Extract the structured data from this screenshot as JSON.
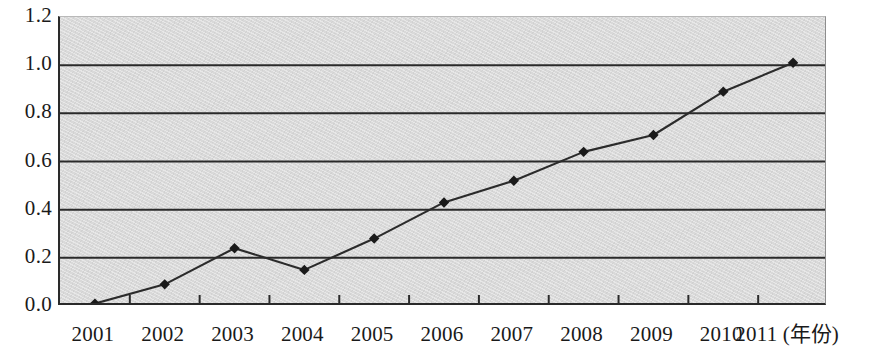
{
  "chart_data": {
    "type": "line",
    "title": "",
    "subtitle": "",
    "xlabel": "(年份)",
    "ylabel": "",
    "categories": [
      "2001",
      "2002",
      "2003",
      "2004",
      "2005",
      "2006",
      "2007",
      "2008",
      "2009",
      "2010",
      "2011"
    ],
    "values": [
      0.01,
      0.09,
      0.24,
      0.15,
      0.28,
      0.43,
      0.52,
      0.64,
      0.71,
      0.89,
      1.01
    ],
    "series": [
      {
        "name": "",
        "values": [
          0.01,
          0.09,
          0.24,
          0.15,
          0.28,
          0.43,
          0.52,
          0.64,
          0.71,
          0.89,
          1.01
        ]
      }
    ],
    "ylim": [
      0.0,
      1.2
    ],
    "y_ticks": [
      "0.0",
      "0.2",
      "0.4",
      "0.6",
      "0.8",
      "1.0",
      "1.2"
    ],
    "y_tick_values": [
      0.0,
      0.2,
      0.4,
      0.6,
      0.8,
      1.0,
      1.2
    ],
    "x_ticks": [
      "2001",
      "2002",
      "2003",
      "2004",
      "2005",
      "2006",
      "2007",
      "2008",
      "2009",
      "2010",
      "2011"
    ],
    "grid": true,
    "grid_axis": "y",
    "legend": false,
    "legend_position": "none",
    "marker": "diamond",
    "annotations": []
  },
  "axes": {
    "x_axis_unit_label": "(年份)",
    "x_last_tick_with_unit": "2011 (年份)"
  },
  "colors": {
    "plot_background": "#d9d9d9",
    "page_background": "#ffffff",
    "gridline": "#2a2a2a",
    "axis_line": "#2a2a2a",
    "series_line": "#2b2b2b",
    "marker_fill": "#1a1a1a",
    "tick_label": "#1a1a1a"
  }
}
